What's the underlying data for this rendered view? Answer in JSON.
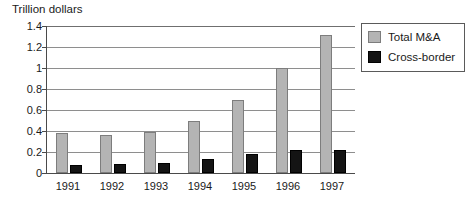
{
  "chart_data": {
    "type": "bar",
    "title": "Trillion dollars",
    "xlabel": "",
    "ylabel": "",
    "ylim": [
      0,
      1.4
    ],
    "yticks": [
      "0",
      "0.2",
      "0.4",
      "0.6",
      "0.8",
      "1",
      "1.2",
      "1.4"
    ],
    "ytick_values": [
      0,
      0.2,
      0.4,
      0.6,
      0.8,
      1,
      1.2,
      1.4
    ],
    "grid": true,
    "legend_position": "top-right",
    "categories": [
      "1991",
      "1992",
      "1993",
      "1994",
      "1995",
      "1996",
      "1997"
    ],
    "series": [
      {
        "name": "Total M&A",
        "color": "#b4b4b4",
        "values": [
          0.385,
          0.365,
          0.39,
          0.5,
          0.7,
          1.0,
          1.31
        ]
      },
      {
        "name": "Cross-border",
        "color": "#141414",
        "values": [
          0.08,
          0.09,
          0.1,
          0.13,
          0.18,
          0.22,
          0.22
        ]
      }
    ]
  },
  "legend": {
    "items": [
      {
        "label": "Total M&A",
        "swatch": "total"
      },
      {
        "label": "Cross-border",
        "swatch": "cross"
      }
    ]
  }
}
